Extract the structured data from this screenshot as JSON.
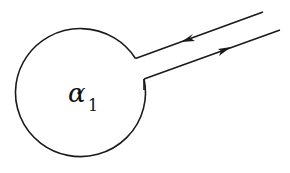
{
  "diagram": {
    "type": "keyhole-contour",
    "label": {
      "symbol": "α",
      "subscript": "1",
      "point_marker": "dot"
    },
    "stroke_color": "#1a1a1a",
    "elements": [
      {
        "name": "circle",
        "center": [
          80,
          93
        ],
        "radius": 65
      },
      {
        "name": "upper-ray",
        "direction": "inward",
        "arrow": "left"
      },
      {
        "name": "lower-ray",
        "direction": "outward",
        "arrow": "right"
      }
    ]
  }
}
